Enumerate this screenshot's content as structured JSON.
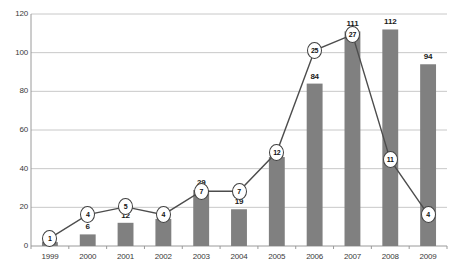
{
  "chart_data": {
    "type": "bar",
    "title": "",
    "subtitle": "",
    "xlabel": "",
    "ylabel": "",
    "ylim": [
      0,
      120
    ],
    "yticks": [
      0,
      20,
      40,
      60,
      80,
      100,
      120
    ],
    "grid": true,
    "legend": false,
    "legend_position": "none",
    "categories": [
      "1999",
      "2000",
      "2001",
      "2002",
      "2003",
      "2004",
      "2005",
      "2006",
      "2007",
      "2008",
      "2009"
    ],
    "series": [
      {
        "name": "bars",
        "type": "bar",
        "color": "#808080",
        "values": [
          2,
          6,
          12,
          14,
          29,
          19,
          46,
          84,
          111,
          112,
          94
        ],
        "labels": [
          "2",
          "6",
          "12",
          "14",
          "29",
          "19",
          "46",
          "84",
          "111",
          "112",
          "94"
        ]
      },
      {
        "name": "line",
        "type": "line",
        "color": "#4d4d4d",
        "marker": "circled-number",
        "values": [
          1,
          4,
          5,
          4,
          7,
          7,
          12,
          25,
          27,
          11,
          4
        ],
        "labels": [
          "1",
          "4",
          "5",
          "4",
          "7",
          "7",
          "12",
          "25",
          "27",
          "11",
          "4"
        ]
      }
    ]
  },
  "axis": {
    "y_tick_labels": [
      "0",
      "20",
      "40",
      "60",
      "80",
      "100",
      "120"
    ],
    "x_tick_labels": [
      "1999",
      "2000",
      "2001",
      "2002",
      "2003",
      "2004",
      "2005",
      "2006",
      "2007",
      "2008",
      "2009"
    ]
  },
  "colors": {
    "bar": "#808080",
    "line": "#4d4d4d",
    "grid": "#c8c8c8",
    "axis": "#9a9a9a",
    "text": "#333333",
    "background": "#ffffff"
  }
}
